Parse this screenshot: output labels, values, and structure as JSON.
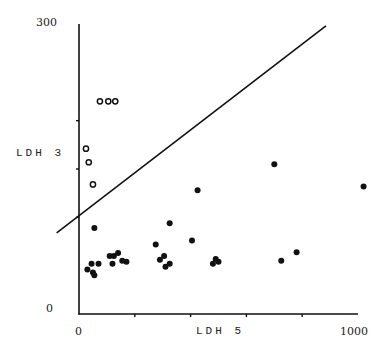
{
  "chart_data": {
    "type": "scatter",
    "title": "",
    "xlabel": "LDH 5",
    "ylabel": "LDH 3",
    "xlim": [
      0,
      1000
    ],
    "ylim": [
      0,
      300
    ],
    "x_tick_labels": [
      "0",
      "1000"
    ],
    "y_tick_labels": [
      "0",
      "300"
    ],
    "x_ticks": [
      0,
      200,
      400,
      600,
      800,
      1000
    ],
    "y_ticks": [
      0,
      100,
      150,
      200,
      300
    ],
    "grid": false,
    "legend": null,
    "series": [
      {
        "name": "open circles",
        "marker": "open-circle",
        "points": [
          [
            75,
            220
          ],
          [
            105,
            220
          ],
          [
            130,
            220
          ],
          [
            25,
            171
          ],
          [
            35,
            157
          ],
          [
            50,
            134
          ]
        ]
      },
      {
        "name": "filled circles",
        "marker": "filled-circle",
        "points": [
          [
            55,
            89
          ],
          [
            30,
            46
          ],
          [
            45,
            52
          ],
          [
            50,
            43
          ],
          [
            55,
            40
          ],
          [
            70,
            52
          ],
          [
            110,
            60
          ],
          [
            125,
            60
          ],
          [
            140,
            63
          ],
          [
            120,
            52
          ],
          [
            155,
            55
          ],
          [
            170,
            54
          ],
          [
            325,
            94
          ],
          [
            275,
            72
          ],
          [
            290,
            56
          ],
          [
            310,
            49
          ],
          [
            305,
            60
          ],
          [
            325,
            52
          ],
          [
            405,
            76
          ],
          [
            425,
            128
          ],
          [
            480,
            52
          ],
          [
            490,
            57
          ],
          [
            500,
            54
          ],
          [
            700,
            155
          ],
          [
            725,
            55
          ],
          [
            780,
            64
          ],
          [
            1020,
            132
          ]
        ]
      }
    ],
    "reference_line": {
      "from": [
        -80,
        84
      ],
      "to": [
        885,
        298
      ]
    }
  },
  "labels": {
    "x_axis": "LDH 5",
    "y_axis": "LDH 3",
    "x_min": "0",
    "x_max": "1000",
    "y_min": "0",
    "y_max": "300"
  }
}
